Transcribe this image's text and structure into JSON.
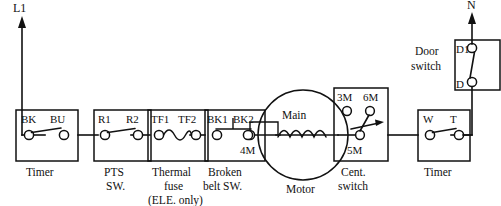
{
  "diagram": {
    "line_color": "#111111",
    "background": "#ffffff",
    "rails": {
      "left": {
        "name": "line-rail",
        "label": "L1"
      },
      "right": {
        "name": "neutral-rail",
        "label": "N"
      }
    },
    "components": [
      {
        "id": "timer-left",
        "caption": "Timer",
        "caption_lines": [
          "Timer"
        ],
        "kind": "spst-switch-box",
        "terminals": [
          "BK",
          "BU"
        ]
      },
      {
        "id": "pts-switch",
        "caption": "PTS SW.",
        "caption_lines": [
          "PTS",
          "SW."
        ],
        "kind": "spst-switch-box",
        "terminals": [
          "R1",
          "R2"
        ]
      },
      {
        "id": "thermal-fuse",
        "caption": "Thermal fuse (ELE. only)",
        "caption_lines": [
          "Thermal",
          "fuse",
          "(ELE. only)"
        ],
        "kind": "fuse-box",
        "terminals": [
          "TF1",
          "TF2"
        ]
      },
      {
        "id": "broken-belt-switch",
        "caption": "Broken belt SW.",
        "caption_lines": [
          "Broken",
          "belt SW."
        ],
        "kind": "bar-actuator-switch-box",
        "terminals": [
          "BK1",
          "BK2"
        ]
      },
      {
        "id": "motor",
        "caption": "Motor",
        "caption_lines": [
          "Motor"
        ],
        "kind": "motor-circle",
        "winding_label": "Main",
        "terminals": [
          "4M"
        ]
      },
      {
        "id": "centrifugal-switch",
        "caption": "Cent. switch",
        "caption_lines": [
          "Cent.",
          "switch"
        ],
        "kind": "centrifugal-switch-box",
        "terminals": [
          "3M",
          "6M",
          "5M"
        ]
      },
      {
        "id": "timer-right",
        "caption": "Timer",
        "caption_lines": [
          "Timer"
        ],
        "kind": "spst-switch-box",
        "terminals": [
          "W",
          "T"
        ]
      },
      {
        "id": "door-switch",
        "caption": "Door switch",
        "caption_lines": [
          "Door",
          "switch"
        ],
        "kind": "vertical-switch-box",
        "terminals": [
          "D1",
          "D"
        ]
      }
    ],
    "labels": {
      "L1": "L1",
      "N": "N",
      "BK": "BK",
      "BU": "BU",
      "R1": "R1",
      "R2": "R2",
      "TF1": "TF1",
      "TF2": "TF2",
      "BK1": "BK1",
      "BK2": "BK2",
      "FOURM": "4M",
      "MAIN": "Main",
      "THREEM": "3M",
      "SIXM": "6M",
      "FIVEM": "5M",
      "W": "W",
      "T": "T",
      "D1": "D1",
      "D": "D",
      "cap_timer_left": "Timer",
      "cap_pts_1": "PTS",
      "cap_pts_2": "SW.",
      "cap_thermal_1": "Thermal",
      "cap_thermal_2": "fuse",
      "cap_thermal_3": "(ELE. only)",
      "cap_belt_1": "Broken",
      "cap_belt_2": "belt SW.",
      "cap_motor": "Motor",
      "cap_cent_1": "Cent.",
      "cap_cent_2": "switch",
      "cap_timer_right": "Timer",
      "cap_door_1": "Door",
      "cap_door_2": "switch"
    }
  }
}
